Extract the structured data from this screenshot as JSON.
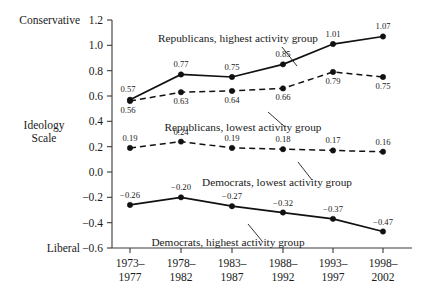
{
  "chart_data": {
    "type": "line",
    "title": "",
    "xlabel": "",
    "ylabel": "Ideology Scale",
    "ylim": [
      -0.6,
      1.2
    ],
    "ytick_labels": [
      "1.2",
      "1.0",
      "0.8",
      "0.6",
      "0.4",
      "0.2",
      "0.0",
      "-0.2",
      "-0.4",
      "-0.6"
    ],
    "ytick_values": [
      1.2,
      1.0,
      0.8,
      0.6,
      0.4,
      0.2,
      0.0,
      -0.2,
      -0.4,
      -0.6
    ],
    "axis_end_labels": {
      "top": "Conservative",
      "bottom": "Liberal",
      "middle_line1": "Ideology",
      "middle_line2": "Scale"
    },
    "categories": [
      "1973–\n1977",
      "1978–\n1982",
      "1983–\n1987",
      "1988–\n1992",
      "1993–\n1997",
      "1998–\n2002"
    ],
    "categories_line1": [
      "1973–",
      "1978–",
      "1983–",
      "1988–",
      "1993–",
      "1998–"
    ],
    "categories_line2": [
      "1977",
      "1982",
      "1987",
      "1992",
      "1997",
      "2002"
    ],
    "grid": false,
    "legend_position": "inline-annotations",
    "series": [
      {
        "name": "Republicans, highest activity group",
        "style": "solid",
        "values": [
          0.57,
          0.77,
          0.75,
          0.85,
          1.01,
          1.07
        ],
        "labels": [
          "0.57",
          "0.77",
          "0.75",
          "0.85",
          "1.01",
          "1.07"
        ],
        "label_positions": [
          "above-left",
          "above",
          "above",
          "above",
          "above",
          "above"
        ]
      },
      {
        "name": "Republicans, lowest activity group",
        "style": "dashed",
        "values": [
          0.56,
          0.63,
          0.64,
          0.66,
          0.79,
          0.75
        ],
        "labels": [
          "0.56",
          "0.63",
          "0.64",
          "0.66",
          "0.79",
          "0.75"
        ],
        "label_positions": [
          "below-left",
          "below",
          "below",
          "below",
          "below",
          "below"
        ]
      },
      {
        "name": "Democrats, lowest activity group",
        "style": "dashed",
        "values": [
          0.19,
          0.24,
          0.19,
          0.18,
          0.17,
          0.16
        ],
        "labels": [
          "0.19",
          "0.24",
          "0.19",
          "0.18",
          "0.17",
          "0.16"
        ],
        "label_positions": [
          "above",
          "above",
          "above",
          "above",
          "above",
          "above"
        ]
      },
      {
        "name": "Democrats, highest activity group",
        "style": "solid",
        "values": [
          -0.26,
          -0.2,
          -0.27,
          -0.32,
          -0.37,
          -0.47
        ],
        "labels": [
          "−0.26",
          "−0.20",
          "−0.27",
          "−0.32",
          "−0.37",
          "−0.47"
        ],
        "label_positions": [
          "above",
          "above",
          "above",
          "above",
          "above",
          "above"
        ]
      }
    ],
    "annotations": [
      {
        "text": "Republicans, highest activity group",
        "x": 238,
        "y": 42
      },
      {
        "text": "Republicans, lowest activity group",
        "x": 243,
        "y": 131
      },
      {
        "text": "Democrats, lowest activity group",
        "x": 277,
        "y": 186
      },
      {
        "text": "Democrats, highest activity group",
        "x": 228,
        "y": 246
      }
    ]
  }
}
